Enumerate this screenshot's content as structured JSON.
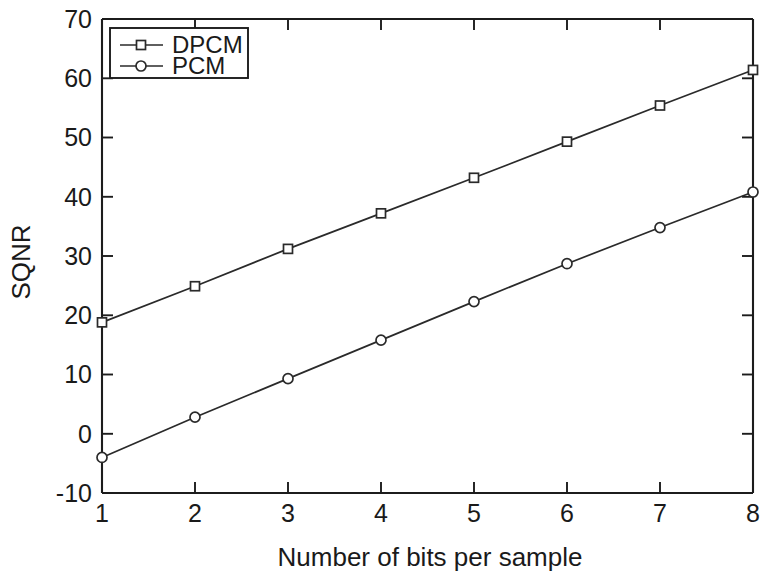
{
  "chart_data": {
    "type": "line",
    "title": "",
    "xlabel": "Number of bits per sample",
    "ylabel": "SQNR",
    "x": [
      1,
      2,
      3,
      4,
      5,
      6,
      7,
      8
    ],
    "xlim": [
      1,
      8
    ],
    "ylim": [
      -10,
      70
    ],
    "xticks": [
      "1",
      "2",
      "3",
      "4",
      "5",
      "6",
      "7",
      "8"
    ],
    "yticks": [
      "-10",
      "0",
      "10",
      "20",
      "30",
      "40",
      "50",
      "60",
      "70"
    ],
    "grid": false,
    "legend_position": "top-left",
    "series": [
      {
        "name": "DPCM",
        "marker": "square",
        "values": [
          18.8,
          24.9,
          31.2,
          37.2,
          43.2,
          49.3,
          55.4,
          61.4
        ]
      },
      {
        "name": "PCM",
        "marker": "circle",
        "values": [
          -4.0,
          2.8,
          9.3,
          15.8,
          22.3,
          28.7,
          34.8,
          40.8
        ]
      }
    ],
    "colors": {
      "axis": "#1c1c1c",
      "line": "#2a2a2a",
      "marker_fill": "#ffffff",
      "background": "#ffffff"
    }
  },
  "legend": {
    "entries": [
      {
        "label": "DPCM"
      },
      {
        "label": "PCM"
      }
    ]
  },
  "axes": {
    "y_title": "SQNR",
    "x_title": "Number of bits per sample",
    "y_tick_0": "70",
    "y_tick_1": "60",
    "y_tick_2": "50",
    "y_tick_3": "40",
    "y_tick_4": "30",
    "y_tick_5": "20",
    "y_tick_6": "10",
    "y_tick_7": "0",
    "y_tick_8": "-10",
    "x_tick_0": "1",
    "x_tick_1": "2",
    "x_tick_2": "3",
    "x_tick_3": "4",
    "x_tick_4": "5",
    "x_tick_5": "6",
    "x_tick_6": "7",
    "x_tick_7": "8"
  }
}
